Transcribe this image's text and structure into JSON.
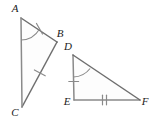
{
  "figure": {
    "background_color": "#ffffff",
    "stroke_color": "#6e6e6e",
    "label_color": "#1b1b1b",
    "fill_color": "#fdfdfd"
  },
  "triangles": [
    {
      "name": "triangle-abc",
      "vertices": [
        {
          "id": "A",
          "label": "A",
          "x": 21,
          "y": 18,
          "label_x": 15,
          "label_y": 12
        },
        {
          "id": "B",
          "label": "B",
          "x": 57,
          "y": 42,
          "label_x": 57,
          "label_y": 37
        },
        {
          "id": "C",
          "label": "C",
          "x": 22,
          "y": 107,
          "label_x": 14,
          "label_y": 116
        }
      ],
      "sides": [
        {
          "id": "AB",
          "from": "A",
          "to": "B",
          "ticks": 0
        },
        {
          "id": "BC",
          "from": "B",
          "to": "C",
          "ticks": 1
        },
        {
          "id": "CA",
          "from": "C",
          "to": "A",
          "ticks": 0
        }
      ],
      "angle_marks": [
        {
          "at": "A",
          "arcs": 1
        }
      ]
    },
    {
      "name": "triangle-def",
      "vertices": [
        {
          "id": "D",
          "label": "D",
          "x": 73,
          "y": 55,
          "label_x": 69,
          "label_y": 50
        },
        {
          "id": "E",
          "label": "E",
          "x": 74,
          "y": 100,
          "label_x": 65,
          "label_y": 105
        },
        {
          "id": "F",
          "label": "F",
          "x": 140,
          "y": 100,
          "label_x": 141,
          "label_y": 105
        }
      ],
      "sides": [
        {
          "id": "DE",
          "from": "D",
          "to": "E",
          "ticks": 1
        },
        {
          "id": "EF",
          "from": "E",
          "to": "F",
          "ticks": 2
        },
        {
          "id": "FD",
          "from": "F",
          "to": "D",
          "ticks": 0
        }
      ],
      "angle_marks": [
        {
          "at": "D",
          "arcs": 1
        }
      ]
    }
  ],
  "labels": {
    "A": "A",
    "B": "B",
    "C": "C",
    "D": "D",
    "E": "E",
    "F": "F"
  }
}
